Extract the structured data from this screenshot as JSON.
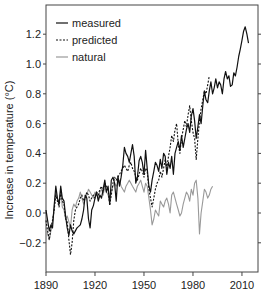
{
  "chart_data": {
    "type": "line",
    "title": "",
    "xlabel": "",
    "ylabel": "Increase in temperature (°C)",
    "xlim": [
      1890,
      2020
    ],
    "ylim": [
      -0.4,
      1.4
    ],
    "xticks": [
      1890,
      1920,
      1950,
      1980,
      2010
    ],
    "yticks": [
      -0.2,
      0.0,
      0.2,
      0.4,
      0.6,
      0.8,
      1.0,
      1.2
    ],
    "ytick_labels": [
      "−0.2",
      "0.0",
      "0.2",
      "0.4",
      "0.6",
      "0.8",
      "1.0",
      "1.2"
    ],
    "grid": false,
    "legend_position": "upper left",
    "series": [
      {
        "name": "measured",
        "style": "solid",
        "color": "#111111",
        "x_start": 1890,
        "values": [
          0.02,
          -0.05,
          -0.12,
          -0.08,
          -0.1,
          0.05,
          0.18,
          0.1,
          0.06,
          0.18,
          0.1,
          0.08,
          -0.02,
          -0.1,
          -0.15,
          -0.08,
          -0.12,
          -0.14,
          -0.12,
          -0.1,
          -0.09,
          -0.08,
          -0.04,
          0.02,
          0.12,
          0.1,
          -0.04,
          -0.1,
          0.02,
          0.05,
          0.1,
          0.14,
          0.08,
          0.12,
          0.1,
          0.16,
          0.22,
          0.14,
          0.18,
          0.06,
          0.22,
          0.24,
          0.2,
          0.08,
          0.25,
          0.18,
          0.24,
          0.32,
          0.44,
          0.4,
          0.38,
          0.34,
          0.4,
          0.46,
          0.38,
          0.2,
          0.24,
          0.35,
          0.38,
          0.34,
          0.26,
          0.42,
          0.3,
          0.18,
          0.14,
          0.22,
          0.28,
          0.34,
          0.32,
          0.28,
          0.36,
          0.3,
          0.4,
          0.38,
          0.26,
          0.34,
          0.3,
          0.38,
          0.26,
          0.4,
          0.44,
          0.48,
          0.42,
          0.52,
          0.44,
          0.5,
          0.56,
          0.6,
          0.54,
          0.65,
          0.7,
          0.62,
          0.5,
          0.58,
          0.66,
          0.6,
          0.72,
          0.82,
          0.76,
          0.74,
          0.82,
          0.88,
          0.8,
          0.84,
          0.9,
          0.84,
          0.88,
          0.86,
          0.8,
          0.9,
          0.95,
          0.9,
          0.92,
          0.85,
          0.86,
          0.94,
          0.92,
          0.98,
          1.05,
          1.1,
          1.16,
          1.22,
          1.25,
          1.2,
          1.14
        ]
      },
      {
        "name": "predicted",
        "style": "dashed",
        "color": "#111111",
        "x_start": 1890,
        "values": [
          -0.05,
          -0.12,
          -0.18,
          -0.1,
          -0.05,
          0.02,
          0.12,
          0.08,
          0.04,
          0.14,
          0.08,
          0.06,
          -0.04,
          -0.06,
          -0.18,
          -0.28,
          -0.2,
          -0.05,
          0.02,
          0.04,
          0.06,
          0.1,
          0.12,
          0.08,
          0.1,
          0.14,
          0.12,
          0.08,
          0.1,
          0.12,
          0.1,
          0.14,
          0.12,
          0.16,
          0.18,
          0.14,
          0.2,
          0.18,
          0.16,
          0.05,
          0.12,
          0.2,
          0.24,
          0.22,
          0.24,
          0.26,
          0.28,
          0.3,
          0.32,
          0.3,
          0.28,
          0.32,
          0.34,
          0.3,
          0.28,
          0.24,
          0.22,
          0.26,
          0.3,
          0.28,
          0.24,
          0.3,
          0.28,
          0.16,
          0.1,
          0.04,
          0.1,
          0.16,
          0.2,
          0.22,
          0.28,
          0.24,
          0.3,
          0.36,
          0.3,
          0.38,
          0.44,
          0.52,
          0.48,
          0.56,
          0.6,
          0.46,
          0.4,
          0.5,
          0.56,
          0.62,
          0.58,
          0.66,
          0.72,
          0.62,
          0.54,
          0.5,
          0.36,
          0.5,
          0.62,
          0.7,
          0.76,
          0.82,
          0.8,
          0.86,
          0.92
        ]
      },
      {
        "name": "natural",
        "style": "solid",
        "color": "#999999",
        "x_start": 1890,
        "values": [
          -0.1,
          -0.14,
          -0.18,
          -0.12,
          -0.06,
          0.04,
          0.14,
          0.1,
          0.06,
          0.16,
          0.04,
          0.02,
          -0.04,
          -0.02,
          -0.06,
          -0.1,
          0.02,
          0.06,
          0.04,
          0.08,
          0.1,
          0.14,
          0.1,
          0.06,
          0.1,
          0.12,
          0.16,
          0.14,
          0.12,
          0.1,
          0.14,
          0.12,
          0.1,
          0.14,
          0.16,
          0.12,
          0.18,
          0.14,
          0.12,
          0.08,
          0.14,
          0.18,
          0.2,
          0.18,
          0.2,
          0.22,
          0.18,
          0.16,
          0.14,
          0.18,
          0.2,
          0.22,
          0.2,
          0.18,
          0.16,
          0.14,
          0.18,
          0.2,
          0.22,
          0.18,
          0.14,
          0.2,
          0.18,
          0.1,
          0.02,
          -0.08,
          -0.04,
          0.02,
          0.0,
          -0.02,
          0.08,
          0.06,
          0.04,
          0.08,
          0.1,
          0.06,
          0.0,
          0.12,
          0.14,
          0.1,
          0.06,
          0.02,
          -0.02,
          0.0,
          0.06,
          0.1,
          0.14,
          0.12,
          0.08,
          0.16,
          0.12,
          0.2,
          0.22,
          0.1,
          -0.14,
          0.0,
          0.08,
          0.16,
          0.14,
          0.1,
          0.12,
          0.16,
          0.18
        ]
      }
    ]
  },
  "legend": {
    "items": [
      {
        "label": "measured",
        "style": "solid",
        "color": "#111111"
      },
      {
        "label": "predicted",
        "style": "dashed",
        "color": "#111111"
      },
      {
        "label": "natural",
        "style": "solid",
        "color": "#999999"
      }
    ]
  },
  "axes": {
    "ylabel": "Increase in temperature (°C)",
    "xtick_labels": [
      "1890",
      "1920",
      "1950",
      "1980",
      "2010"
    ],
    "ytick_labels": [
      "−0.2",
      "0.0",
      "0.2",
      "0.4",
      "0.6",
      "0.8",
      "1.0",
      "1.2"
    ]
  }
}
